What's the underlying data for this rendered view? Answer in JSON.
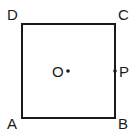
{
  "diagram": {
    "type": "geometry",
    "shape": "square",
    "stroke_color": "#1a1a1a",
    "background": "#ffffff",
    "vertices": {
      "A": {
        "label": "A",
        "position": "bottom-left"
      },
      "B": {
        "label": "B",
        "position": "bottom-right"
      },
      "C": {
        "label": "C",
        "position": "top-right"
      },
      "D": {
        "label": "D",
        "position": "top-left"
      }
    },
    "points": {
      "O": {
        "label": "O",
        "description": "center of square"
      },
      "P": {
        "label": "P",
        "description": "midpoint of side BC"
      }
    }
  }
}
